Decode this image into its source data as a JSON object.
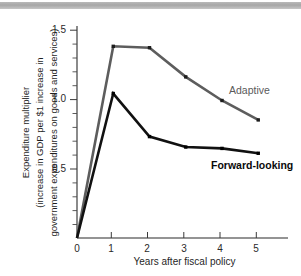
{
  "figure": {
    "background_color": "#ffffff",
    "banner_color": "#b0b0b0"
  },
  "chart_data": {
    "type": "line",
    "title": "",
    "subtitle": "",
    "xlabel": "Years after fiscal policy",
    "ylabel": "Expenditure multiplier (increase in GDP per $1 increase in government expenditures on goods and services)",
    "ylabel_lines": [
      "Expenditure multiplier",
      "(increase in GDP per $1 increase in",
      "government expenditures on goods and services)"
    ],
    "x": [
      0,
      1,
      2,
      3,
      4,
      5
    ],
    "xlim": [
      0,
      5.4
    ],
    "ylim": [
      0,
      1.62
    ],
    "xticks": [
      0,
      1,
      2,
      3,
      4,
      5
    ],
    "xtick_labels": [
      "0",
      "1",
      "2",
      "3",
      "4",
      "5"
    ],
    "yticks": [
      0.5,
      1.0,
      1.5
    ],
    "ytick_labels": [
      "0.5",
      "1.0",
      "1.5"
    ],
    "y_origin_label": "0",
    "y_minor_ticks": [
      0.1,
      0.2,
      0.3,
      0.4,
      0.6,
      0.7,
      0.8,
      0.9,
      1.1,
      1.2,
      1.3,
      1.4
    ],
    "grid": false,
    "legend_position": "inline-annotations",
    "series": [
      {
        "name": "Adaptive",
        "color": "#5d5d5d",
        "label_color": "#5a5a5a",
        "label_bold": false,
        "values": [
          0,
          1.38,
          1.37,
          1.16,
          0.99,
          0.85
        ]
      },
      {
        "name": "Forward-looking",
        "color": "#111111",
        "label_color": "#0a0a0a",
        "label_bold": true,
        "values": [
          0,
          1.04,
          0.73,
          0.655,
          0.645,
          0.61
        ]
      }
    ],
    "annotations": [
      {
        "text": "Adaptive",
        "x": 4.25,
        "y": 1.12
      },
      {
        "text": "Forward-looking",
        "x": 3.7,
        "y": 0.585
      }
    ]
  }
}
